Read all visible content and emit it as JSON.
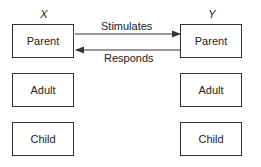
{
  "diagram": {
    "left_column": {
      "label": "X",
      "boxes": [
        "Parent",
        "Adult",
        "Child"
      ]
    },
    "right_column": {
      "label": "Y",
      "boxes": [
        "Parent",
        "Adult",
        "Child"
      ]
    },
    "arrows": [
      {
        "from": "X.Parent",
        "to": "Y.Parent",
        "label": "Stimulates"
      },
      {
        "from": "Y.Parent",
        "to": "X.Parent",
        "label": "Responds"
      }
    ]
  }
}
